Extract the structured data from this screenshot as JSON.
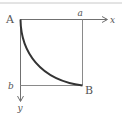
{
  "diagram": {
    "type": "brachistochrone-curve",
    "labels": {
      "origin": "A",
      "end_point": "B",
      "x_axis": "x",
      "y_axis": "y",
      "x_mark": "a",
      "y_mark": "b"
    },
    "colors": {
      "axis": "#707070",
      "curve": "#333333",
      "guide": "#8a8a8a",
      "top_rule": "#c8c8c8",
      "text": "#555555"
    }
  }
}
